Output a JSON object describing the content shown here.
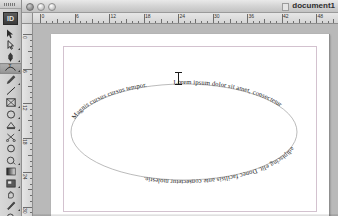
{
  "window": {
    "title": "document1",
    "app_name": "Adobe InDesign",
    "traffic_lights": [
      {
        "name": "close",
        "label": "Close"
      },
      {
        "name": "minimize",
        "label": "Minimize"
      },
      {
        "name": "zoom",
        "label": "Zoom"
      }
    ]
  },
  "toolbar": {
    "logo_label": "ID",
    "tools": [
      {
        "name": "selection-tool",
        "label": "Selection",
        "active": false,
        "has_flyout": false
      },
      {
        "name": "direct-selection-tool",
        "label": "Direct Selection",
        "active": false,
        "has_flyout": true
      },
      {
        "name": "pen-tool",
        "label": "Pen",
        "active": false,
        "has_flyout": true
      },
      {
        "name": "type-on-path-tool",
        "label": "Type on a Path",
        "active": true,
        "has_flyout": true
      },
      {
        "name": "pencil-tool",
        "label": "Pencil",
        "active": false,
        "has_flyout": true
      },
      {
        "name": "line-tool",
        "label": "Line",
        "active": false,
        "has_flyout": false
      },
      {
        "name": "rectangle-frame-tool",
        "label": "Rectangle Frame",
        "active": false,
        "has_flyout": true
      },
      {
        "name": "rectangle-tool",
        "label": "Rectangle",
        "active": false,
        "has_flyout": true
      },
      {
        "name": "rotate-tool",
        "label": "Rotate",
        "active": false,
        "has_flyout": true
      },
      {
        "name": "scissors-tool",
        "label": "Scissors",
        "active": false,
        "has_flyout": false
      },
      {
        "name": "free-transform-tool",
        "label": "Free Transform",
        "active": false,
        "has_flyout": false
      },
      {
        "name": "gradient-swatch-tool",
        "label": "Gradient Swatch",
        "active": false,
        "has_flyout": true
      },
      {
        "name": "gradient-feather-tool",
        "label": "Gradient Feather",
        "active": false,
        "has_flyout": false
      },
      {
        "name": "note-tool",
        "label": "Note",
        "active": false,
        "has_flyout": true
      },
      {
        "name": "hand-tool",
        "label": "Hand",
        "active": false,
        "has_flyout": false
      },
      {
        "name": "eyedropper-tool",
        "label": "Eyedropper",
        "active": false,
        "has_flyout": true
      },
      {
        "name": "zoom-tool",
        "label": "Zoom",
        "active": false,
        "has_flyout": false
      },
      {
        "name": "fill-stroke-proxy",
        "label": "Fill and Stroke",
        "active": false,
        "has_flyout": false
      }
    ]
  },
  "rulers": {
    "units": "picas",
    "horizontal_labels": [
      "0",
      "6",
      "12",
      "18",
      "24",
      "30",
      "36",
      "42",
      "48"
    ],
    "horizontal_step_px": 34.5,
    "horizontal_origin_px": 18,
    "vertical_labels": [
      "0",
      "6",
      "12",
      "18",
      "24",
      "30"
    ],
    "vertical_step_px": 34.5,
    "vertical_origin_px": 10
  },
  "document": {
    "zoom_level": "100%",
    "page_number": "1",
    "artwork": {
      "name": "text-on-ellipse-path",
      "shape": "ellipse",
      "text": "Lorem ipsum dolor sit amet, consectetur adipiscing elit. Donec facilisis ante consectetur molestie.",
      "text_segments": [
        "Lorem ipsum dolor sit amet, consectetur",
        "adipiscing elit. Donec facilisis ante",
        "consectetur molestie.",
        "Magnis cursus cursus tempor."
      ],
      "stroke_color": "#9a9a9a",
      "text_color": "#1c1c1c"
    },
    "cursor": {
      "name": "text-insertion-cursor",
      "type": "i-beam"
    }
  }
}
